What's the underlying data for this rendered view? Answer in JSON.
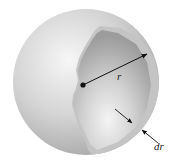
{
  "figure": {
    "labels": {
      "radius": "r",
      "shell_thickness": "dr"
    },
    "colors": {
      "sphere_outer": "#b9b9b9",
      "sphere_highlight": "#f4f4f4",
      "cutaway_inner": "#a9a9a9",
      "shell_band": "#c8c8c8",
      "arrow": "#111111"
    }
  }
}
